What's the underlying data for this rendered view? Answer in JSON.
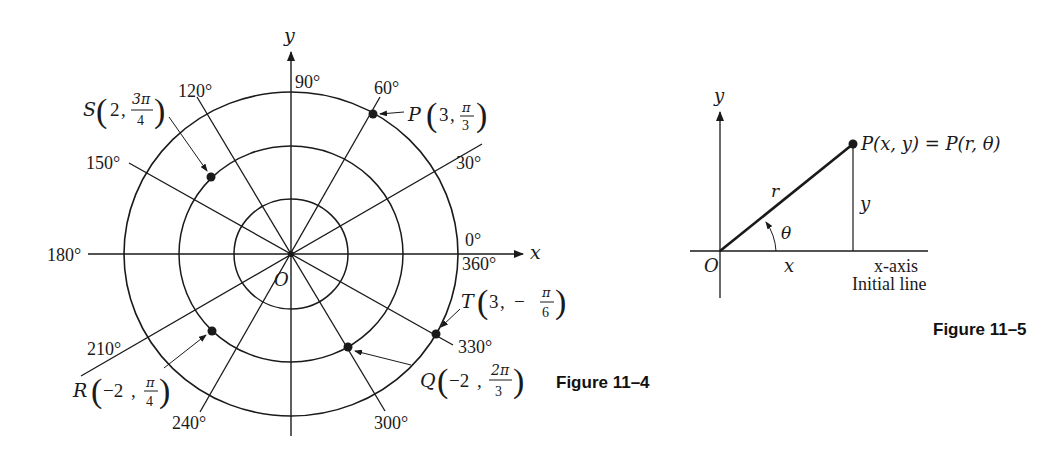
{
  "figure_11_4": {
    "caption": "Figure 11–4",
    "axis_labels": {
      "x": "x",
      "y": "y",
      "origin": "O"
    },
    "angle_labels": {
      "a0": "0°",
      "a360": "360°",
      "a30": "30°",
      "a60": "60°",
      "a90": "90°",
      "a120": "120°",
      "a150": "150°",
      "a180": "180°",
      "a210": "210°",
      "a240": "240°",
      "a300": "300°",
      "a330": "330°"
    },
    "circles": [
      1,
      2,
      3
    ],
    "points": {
      "P": {
        "name": "P",
        "r": "3",
        "theta_num": "π",
        "theta_den": "3",
        "sign": ""
      },
      "S": {
        "name": "S",
        "r": "2",
        "theta_num": "3π",
        "theta_den": "4",
        "sign": ""
      },
      "R": {
        "name": "R",
        "r": "−2",
        "theta_num": "π",
        "theta_den": "4",
        "sign": ""
      },
      "Q": {
        "name": "Q",
        "r": "−2",
        "theta_num": "2π",
        "theta_den": "3",
        "sign": ""
      },
      "T": {
        "name": "T",
        "r": "3",
        "theta_num": "π",
        "theta_den": "6",
        "sign": "−"
      }
    }
  },
  "figure_11_5": {
    "caption": "Figure 11–5",
    "axis_y": "y",
    "origin": "O",
    "label_r": "r",
    "label_theta": "θ",
    "label_x": "x",
    "label_y": "y",
    "point_label": "P(x, y) = P(r, θ)",
    "x_axis_label": "x-axis",
    "initial_line_label": "Initial line"
  }
}
